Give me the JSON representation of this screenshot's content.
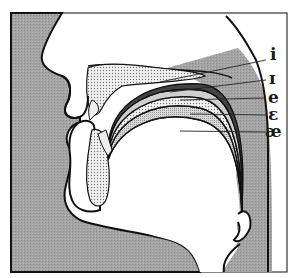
{
  "figure": {
    "colors": {
      "tissue_fill": "#9c9c9c",
      "outline": "#111111",
      "bone_fill": "#e6e6e6",
      "background": "#ffffff",
      "frame": "#333333"
    },
    "labels": [
      {
        "id": "i",
        "text": "i"
      },
      {
        "id": "I",
        "text": "ɪ"
      },
      {
        "id": "e",
        "text": "e"
      },
      {
        "id": "epsilon",
        "text": "ɛ"
      },
      {
        "id": "ae",
        "text": "æ"
      }
    ]
  }
}
